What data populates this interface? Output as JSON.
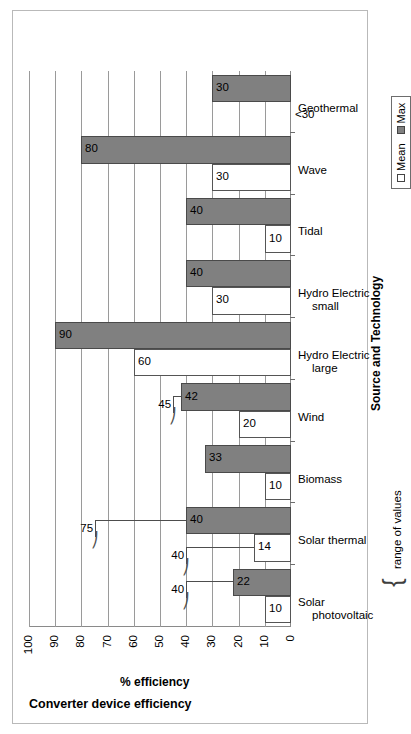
{
  "chart_data": {
    "type": "bar",
    "orientation": "vertical-rotated",
    "title": "Converter device efficiency",
    "xlabel": "Source and Technology",
    "ylabel": "% efficiency",
    "ylim": [
      0,
      100
    ],
    "yticks": [
      "0",
      "10",
      "20",
      "30",
      "40",
      "50",
      "60",
      "70",
      "80",
      "90",
      "100"
    ],
    "grid": true,
    "legend_position": "below-right",
    "categories": [
      "Solar photovoltaic",
      "Solar thermal",
      "Biomass",
      "Wind",
      "Hydro Electric large",
      "Hydro Electric small",
      "Tidal",
      "Wave",
      "Geothermal"
    ],
    "series": [
      {
        "name": "Mean",
        "values": [
          10,
          14,
          10,
          20,
          60,
          30,
          10,
          30,
          0
        ]
      },
      {
        "name": "Max",
        "values": [
          22,
          40,
          33,
          42,
          90,
          40,
          40,
          80,
          30
        ]
      }
    ],
    "data_labels": {
      "Mean": [
        "10",
        "14",
        "10",
        "20",
        "60",
        "30",
        "10",
        "30",
        "<30"
      ],
      "Max": [
        "22",
        "40",
        "33",
        "42",
        "90",
        "40",
        "40",
        "80",
        "30"
      ]
    },
    "annotations": [
      {
        "text": "40",
        "note": "range of values upper bound for Solar photovoltaic"
      },
      {
        "text": "40",
        "note": "range of values upper bound for Solar thermal mean"
      },
      {
        "text": "75",
        "note": "range of values upper bound for Solar thermal max"
      },
      {
        "text": "45",
        "note": "range of values upper bound for Wind max"
      },
      {
        "text": "range of values",
        "note": "brace legend for range annotations"
      }
    ]
  },
  "chart": {
    "title": "Converter device efficiency",
    "value_axis_label": "% efficiency",
    "category_axis_label": "Source and Technology",
    "range_note": "range of values",
    "ticks": [
      "0",
      "10",
      "20",
      "30",
      "40",
      "50",
      "60",
      "70",
      "80",
      "90",
      "100"
    ],
    "legend": {
      "mean_label": "Mean",
      "max_label": "Max"
    },
    "categories": [
      {
        "line1": "Solar",
        "line2": "photovoltaic"
      },
      {
        "line1": "Solar thermal",
        "line2": ""
      },
      {
        "line1": "Biomass",
        "line2": ""
      },
      {
        "line1": "Wind",
        "line2": ""
      },
      {
        "line1": "Hydro Electric",
        "line2": "large"
      },
      {
        "line1": "Hydro Electric",
        "line2": "small"
      },
      {
        "line1": "Tidal",
        "line2": ""
      },
      {
        "line1": "Wave",
        "line2": ""
      },
      {
        "line1": "Geothermal",
        "line2": ""
      }
    ],
    "bar_labels": {
      "mean": [
        "10",
        "14",
        "10",
        "20",
        "60",
        "30",
        "10",
        "30",
        "<30"
      ],
      "max": [
        "22",
        "40",
        "33",
        "42",
        "90",
        "40",
        "40",
        "80",
        "30"
      ]
    },
    "range_labels": {
      "pv_max_range": "40",
      "thermal_mean_range": "40",
      "thermal_max_range": "75",
      "wind_max_range": "45"
    },
    "colors": {
      "mean_fill": "#ffffff",
      "max_fill": "#808080",
      "grid": "#9a9a9a",
      "axis": "#8a8a8a",
      "frame": "#b9b9b9"
    }
  }
}
